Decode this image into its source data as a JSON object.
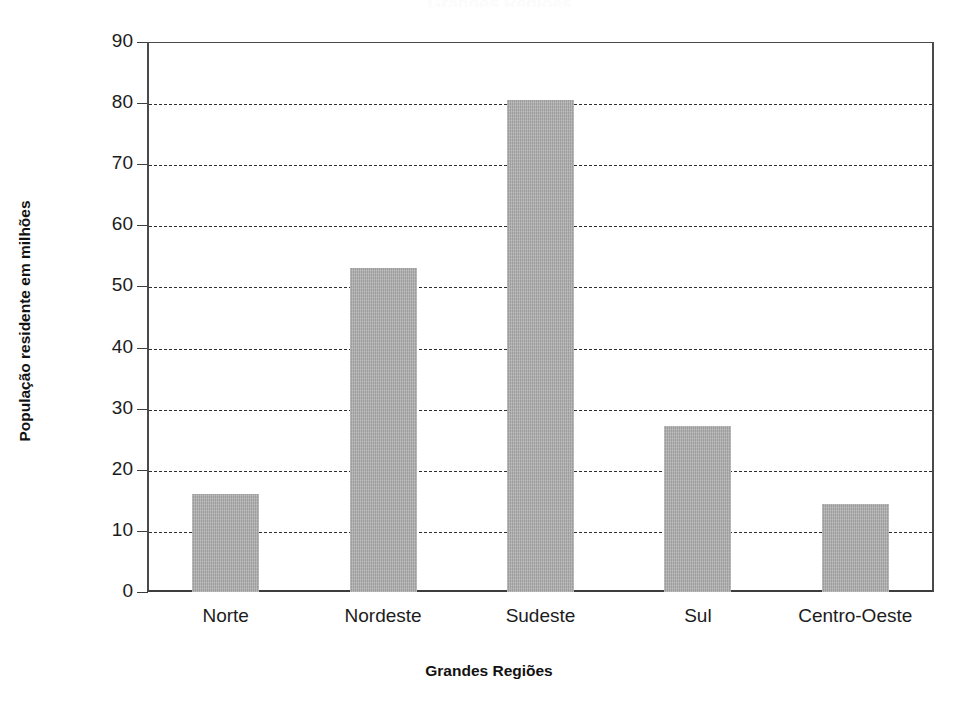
{
  "chart_data": {
    "type": "bar",
    "title": "",
    "categories": [
      "Norte",
      "Nordeste",
      "Sudeste",
      "Sul",
      "Centro-Oeste"
    ],
    "values": [
      16.1,
      53.1,
      80.5,
      27.2,
      14.4
    ],
    "xlabel": "Grandes Regiões",
    "ylabel": "População residente em milhões",
    "ylim": [
      0,
      90
    ],
    "ytick_labels": [
      "0",
      "10",
      "20",
      "30",
      "40",
      "50",
      "60",
      "70",
      "80",
      "90"
    ],
    "ytick_values": [
      0,
      10,
      20,
      30,
      40,
      50,
      60,
      70,
      80,
      90
    ],
    "grid": "horizontal-dashed",
    "legend": "none",
    "bar_color": "#ababab",
    "axis_color": "#3d3d3d",
    "grid_color": "#2e2e2e",
    "background_color": "#ffffff"
  },
  "title_remnant": {
    "text": "Grandes Regiões"
  }
}
